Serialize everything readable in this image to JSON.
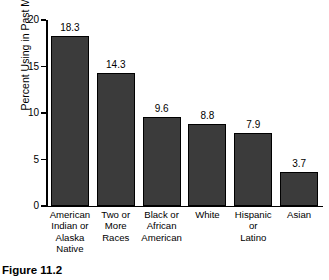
{
  "caption": "Figure 11.2",
  "chart_data": {
    "type": "bar",
    "title": "",
    "xlabel": "",
    "ylabel": "Percent Using in Past Month",
    "ylim": [
      0,
      20
    ],
    "yticks": [
      0,
      5,
      10,
      15,
      20
    ],
    "ytick_labels": [
      "0",
      "5",
      "10",
      "15",
      "20"
    ],
    "grid": false,
    "legend": false,
    "bar_color": "#3b3b3b",
    "bar_edge_color": "#000000",
    "background": "#ffffff",
    "categories": [
      "American Indian or Alaska Native",
      "Two or More Races",
      "Black or African American",
      "White",
      "Hispanic or Latino",
      "Asian"
    ],
    "category_label_lines": [
      [
        "American",
        "Indian or",
        "Alaska",
        "Native"
      ],
      [
        "Two or",
        "More",
        "Races"
      ],
      [
        "Black or",
        "African",
        "American"
      ],
      [
        "White"
      ],
      [
        "Hispanic",
        "or",
        "Latino"
      ],
      [
        "Asian"
      ]
    ],
    "values": [
      18.3,
      14.3,
      9.6,
      8.8,
      7.9,
      3.7
    ],
    "value_labels": [
      "18.3",
      "14.3",
      "9.6",
      "8.8",
      "7.9",
      "3.7"
    ]
  }
}
